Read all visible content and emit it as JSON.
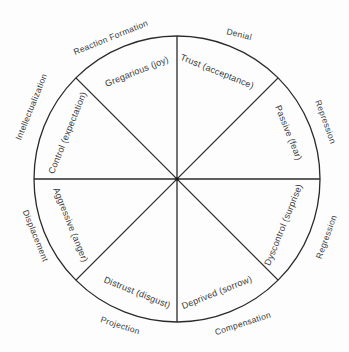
{
  "diagram": {
    "type": "wheel",
    "center": [
      177,
      179
    ],
    "radius": 143,
    "spokes": 8,
    "line_color": "#2a2a2a",
    "text_color": "#3a3a3a",
    "inner_labels": [
      {
        "text": "Gregarious  (joy)",
        "x": 137,
        "y": 72,
        "rotate": -22
      },
      {
        "text": "Trust  (acceptance)",
        "x": 217,
        "y": 72,
        "rotate": 22
      },
      {
        "text": "Passive  (fear)",
        "x": 288,
        "y": 133,
        "rotate": 68
      },
      {
        "text": "Dyscontrol  (surprise)",
        "x": 284,
        "y": 225,
        "rotate": -68
      },
      {
        "text": "Deprived  (sorrow)",
        "x": 217,
        "y": 293,
        "rotate": -22
      },
      {
        "text": "Distrust  (disgust)",
        "x": 137,
        "y": 293,
        "rotate": 22
      },
      {
        "text": "Aggressive  (anger)",
        "x": 70,
        "y": 225,
        "rotate": 68
      },
      {
        "text": "Control  (expectation)",
        "x": 68,
        "y": 133,
        "rotate": -68
      }
    ],
    "outer_labels": [
      {
        "text": "Reaction Formation",
        "x": 111,
        "y": 38,
        "rotate": -22
      },
      {
        "text": "Denial",
        "x": 239,
        "y": 35,
        "rotate": 14
      },
      {
        "text": "Repression",
        "x": 325,
        "y": 122,
        "rotate": 70
      },
      {
        "text": "Regression",
        "x": 327,
        "y": 237,
        "rotate": -70
      },
      {
        "text": "Compensation",
        "x": 243,
        "y": 324,
        "rotate": -18
      },
      {
        "text": "Projection",
        "x": 120,
        "y": 326,
        "rotate": 18
      },
      {
        "text": "Displacement",
        "x": 35,
        "y": 236,
        "rotate": 68
      },
      {
        "text": "Intellectualization",
        "x": 32,
        "y": 107,
        "rotate": -68
      }
    ]
  }
}
